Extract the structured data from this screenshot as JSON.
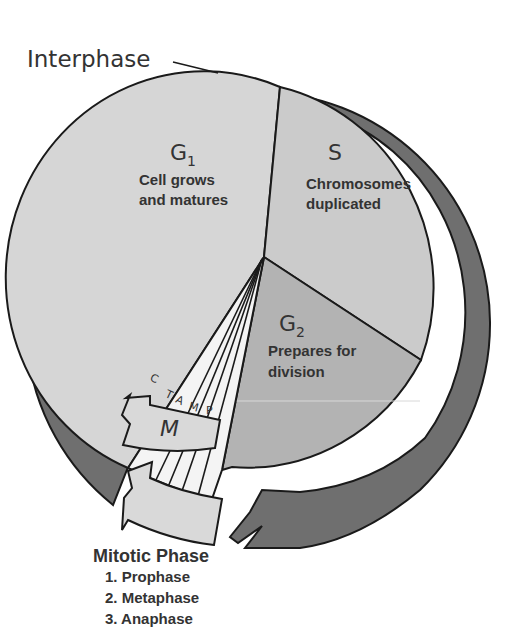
{
  "colors": {
    "background": "#ffffff",
    "ring": "#6f6f6f",
    "g1": "#d6d6d6",
    "s": "#cbcbcb",
    "g2": "#b3b3b3",
    "mitotic_wedge": "#f2f2f2",
    "m_arrow": "#d9d9d9",
    "outline": "#1a1a1a",
    "text": "#333333"
  },
  "interphase": {
    "label": "Interphase"
  },
  "phases": {
    "g1": {
      "name": "G",
      "subscript": "1",
      "desc_line1": "Cell grows",
      "desc_line2": "and matures"
    },
    "s": {
      "name": "S",
      "desc_line1": "Chromosomes",
      "desc_line2": "duplicated"
    },
    "g2": {
      "name": "G",
      "subscript": "2",
      "desc_line1": "Prepares for",
      "desc_line2": "division"
    },
    "m": {
      "name": "M"
    }
  },
  "mitotic_substages": [
    {
      "letter": "C"
    },
    {
      "letter": "T"
    },
    {
      "letter": "A"
    },
    {
      "letter": "M"
    },
    {
      "letter": "P"
    }
  ],
  "mitotic_phase": {
    "title": "Mitotic Phase",
    "items": [
      "1. Prophase",
      "2. Metaphase",
      "3. Anaphase"
    ]
  }
}
